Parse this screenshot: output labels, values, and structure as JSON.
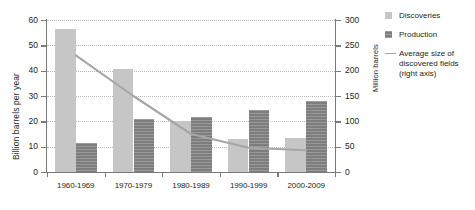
{
  "chart_data": {
    "type": "bar",
    "title": "",
    "subtitle": "",
    "categories": [
      "1960-1969",
      "1970-1979",
      "1980-1989",
      "1990-1999",
      "2000-2009"
    ],
    "series": [
      {
        "name": "Discoveries",
        "axis": "left",
        "color": "#c6c6c6",
        "values": [
          56.5,
          40.5,
          20.0,
          13.0,
          13.5
        ]
      },
      {
        "name": "Production",
        "axis": "left",
        "color": "#7d7d7d",
        "values": [
          11.5,
          20.8,
          21.8,
          24.5,
          28.0
        ]
      },
      {
        "name": "Average size of discovered fields (right axis)",
        "type": "line",
        "axis": "right",
        "color": "#a6a6a6",
        "values": [
          230,
          150,
          75,
          48,
          43
        ]
      }
    ],
    "xlabel": "",
    "ylabel": "Billion barrels per year",
    "ylabel_right": "Million barrels",
    "ylim": [
      0,
      60
    ],
    "ylim_right": [
      0,
      300
    ],
    "yticks": [
      "0",
      "10",
      "20",
      "30",
      "40",
      "50",
      "60"
    ],
    "yticks_right": [
      "0",
      "50",
      "100",
      "150",
      "200",
      "250",
      "300"
    ],
    "grid": true,
    "legend_position": "right"
  },
  "legend": {
    "items": [
      {
        "label": "Discoveries",
        "swatch": "square-light"
      },
      {
        "label": "Production",
        "swatch": "square-dark"
      },
      {
        "label": "Average size of\ndiscovered fields\n(right axis)",
        "swatch": "line",
        "line1": "Average size of",
        "line2": "discovered fields",
        "line3": "(right axis)"
      }
    ]
  },
  "colors": {
    "discoveries": "#c6c6c6",
    "production": "#7d7d7d",
    "trend_line": "#a6a6a6",
    "axis": "#7a7a7a",
    "grid": "#b9b9b9",
    "text": "#231f20",
    "background": "#ffffff"
  }
}
